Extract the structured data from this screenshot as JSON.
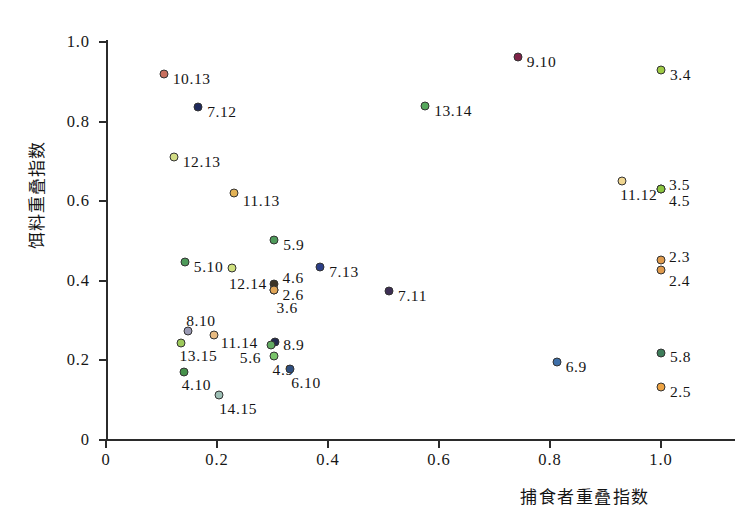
{
  "chart_data": {
    "type": "scatter",
    "title": "",
    "xlabel": "捕食者重叠指数",
    "ylabel": "饵料重叠指数",
    "xlim": [
      0,
      1.1
    ],
    "ylim": [
      0,
      1.05
    ],
    "grid": false,
    "legend": "none",
    "xticks": [
      "0",
      "0.2",
      "0.4",
      "0.6",
      "0.8",
      "1.0"
    ],
    "xtick_values": [
      0,
      0.2,
      0.4,
      0.6,
      0.8,
      1.0
    ],
    "yticks": [
      "0",
      "0.2",
      "0.4",
      "0.6",
      "0.8",
      "1.0"
    ],
    "ytick_values": [
      0,
      0.2,
      0.4,
      0.6,
      0.8,
      1.0
    ],
    "points": [
      {
        "label": "10.13",
        "x": 0.104,
        "y": 0.92,
        "color": "#c9705f",
        "lx": 9,
        "ly": 5
      },
      {
        "label": "7.12",
        "x": 0.166,
        "y": 0.837,
        "color": "#1f2a5c",
        "lx": 9,
        "ly": 5
      },
      {
        "label": "12.13",
        "x": 0.122,
        "y": 0.712,
        "color": "#d3dd85",
        "lx": 9,
        "ly": 5
      },
      {
        "label": "11.13",
        "x": 0.23,
        "y": 0.62,
        "color": "#e2b256",
        "lx": 9,
        "ly": 8
      },
      {
        "label": "5.9",
        "x": 0.303,
        "y": 0.503,
        "color": "#4e9a5a",
        "lx": 9,
        "ly": 5
      },
      {
        "label": "5.10",
        "x": 0.142,
        "y": 0.448,
        "color": "#4e9a5a",
        "lx": 9,
        "ly": 5
      },
      {
        "label": "12.14",
        "x": 0.227,
        "y": 0.432,
        "color": "#cfe07e",
        "lx": -3,
        "ly": 16
      },
      {
        "label": "7.13",
        "x": 0.386,
        "y": 0.435,
        "color": "#2c3f87",
        "lx": 9,
        "ly": 5
      },
      {
        "label": "4.6",
        "x": 0.302,
        "y": 0.392,
        "color": "#3b3326",
        "lx": 9,
        "ly": -6
      },
      {
        "label": "2.6",
        "x": 0.302,
        "y": 0.378,
        "color": "#e0a557",
        "lx": 9,
        "ly": 5
      },
      {
        "label": "3.6",
        "x": 0.302,
        "y": 0.378,
        "color": "#e0a557",
        "lx": 3,
        "ly": 18
      },
      {
        "label": "7.11",
        "x": 0.51,
        "y": 0.375,
        "color": "#3d2f54",
        "lx": 9,
        "ly": 5
      },
      {
        "label": "8.10",
        "x": 0.148,
        "y": 0.273,
        "color": "#9a9ab4",
        "lx": -2,
        "ly": -10
      },
      {
        "label": "13.15",
        "x": 0.136,
        "y": 0.243,
        "color": "#9dc95b",
        "lx": -2,
        "ly": 13
      },
      {
        "label": "11.14",
        "x": 0.194,
        "y": 0.263,
        "color": "#e8bb81",
        "lx": 7,
        "ly": 8
      },
      {
        "label": "8.9",
        "x": 0.305,
        "y": 0.245,
        "color": "#232a4e",
        "lx": 8,
        "ly": 3
      },
      {
        "label": "5.6",
        "x": 0.297,
        "y": 0.238,
        "color": "#62ab62",
        "lx": -31,
        "ly": 13
      },
      {
        "label": "4.9",
        "x": 0.302,
        "y": 0.21,
        "color": "#79c46a",
        "lx": -1,
        "ly": 14
      },
      {
        "label": "4.10",
        "x": 0.14,
        "y": 0.172,
        "color": "#47914b",
        "lx": -2,
        "ly": 13
      },
      {
        "label": "6.10",
        "x": 0.332,
        "y": 0.178,
        "color": "#2f4f7f",
        "lx": 1,
        "ly": 14
      },
      {
        "label": "14.15",
        "x": 0.204,
        "y": 0.112,
        "color": "#9dbfb5",
        "lx": 0,
        "ly": 14
      },
      {
        "label": "9.10",
        "x": 0.742,
        "y": 0.963,
        "color": "#7f2348",
        "lx": 9,
        "ly": 5
      },
      {
        "label": "3.4",
        "x": 1.0,
        "y": 0.93,
        "color": "#9fcb45",
        "lx": 9,
        "ly": 5
      },
      {
        "label": "13.14",
        "x": 0.575,
        "y": 0.838,
        "color": "#56a85c",
        "lx": 9,
        "ly": 5
      },
      {
        "label": "11.12",
        "x": 0.93,
        "y": 0.652,
        "color": "#f0d691",
        "lx": -2,
        "ly": 14
      },
      {
        "label": "3.5",
        "x": 1.0,
        "y": 0.63,
        "color": "#8cc540",
        "lx": 8,
        "ly": -4
      },
      {
        "label": "4.5",
        "x": 1.0,
        "y": 0.63,
        "color": "#8cc540",
        "lx": 8,
        "ly": 12
      },
      {
        "label": "2.3",
        "x": 1.0,
        "y": 0.453,
        "color": "#e09b4d",
        "lx": 8,
        "ly": -3
      },
      {
        "label": "2.4",
        "x": 1.0,
        "y": 0.428,
        "color": "#e09b4d",
        "lx": 8,
        "ly": 11
      },
      {
        "label": "5.8",
        "x": 1.0,
        "y": 0.218,
        "color": "#3e7d5a",
        "lx": 9,
        "ly": 4
      },
      {
        "label": "6.9",
        "x": 0.812,
        "y": 0.195,
        "color": "#3e6fa8",
        "lx": 9,
        "ly": 5
      },
      {
        "label": "2.5",
        "x": 1.0,
        "y": 0.133,
        "color": "#eda343",
        "lx": 9,
        "ly": 5
      }
    ]
  }
}
